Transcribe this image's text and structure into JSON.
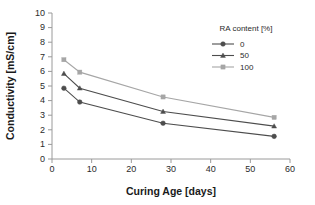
{
  "chart_data": {
    "type": "line",
    "title": "",
    "xlabel": "Curing Age [days]",
    "ylabel": "Conductivity [mS/cm]",
    "xlim": [
      0,
      60
    ],
    "ylim": [
      0,
      10
    ],
    "xticks": [
      0,
      10,
      20,
      30,
      40,
      50,
      60
    ],
    "yticks": [
      0,
      1,
      2,
      3,
      4,
      5,
      6,
      7,
      8,
      9,
      10
    ],
    "grid": false,
    "legend_position": "upper-right",
    "legend_title": "RA content [%]",
    "x": [
      3,
      7,
      28,
      56
    ],
    "series": [
      {
        "name": "0",
        "marker": "circle",
        "color": "#4d4d4d",
        "values": [
          4.85,
          3.9,
          2.45,
          1.55
        ]
      },
      {
        "name": "50",
        "marker": "triangle",
        "color": "#4d4d4d",
        "values": [
          5.85,
          4.85,
          3.25,
          2.25
        ]
      },
      {
        "name": "100",
        "marker": "square",
        "color": "#a6a6a6",
        "values": [
          6.8,
          5.95,
          4.25,
          2.85
        ]
      }
    ]
  },
  "axis": {
    "x_title": "Curing Age [days]",
    "y_title": "Conductivity [mS/cm]",
    "x_ticklabels": [
      "0",
      "10",
      "20",
      "30",
      "40",
      "50",
      "60"
    ],
    "y_ticklabels": [
      "0",
      "1",
      "2",
      "3",
      "4",
      "5",
      "6",
      "7",
      "8",
      "9",
      "10"
    ]
  },
  "legend": {
    "title": "RA content [%]",
    "items": [
      {
        "label": "0"
      },
      {
        "label": "50"
      },
      {
        "label": "100"
      }
    ]
  },
  "colors": {
    "series_0": "#4d4d4d",
    "series_50": "#4d4d4d",
    "series_100": "#a6a6a6",
    "axis": "#9a9a9a",
    "text": "#2b2b2b",
    "background": "#ffffff"
  }
}
